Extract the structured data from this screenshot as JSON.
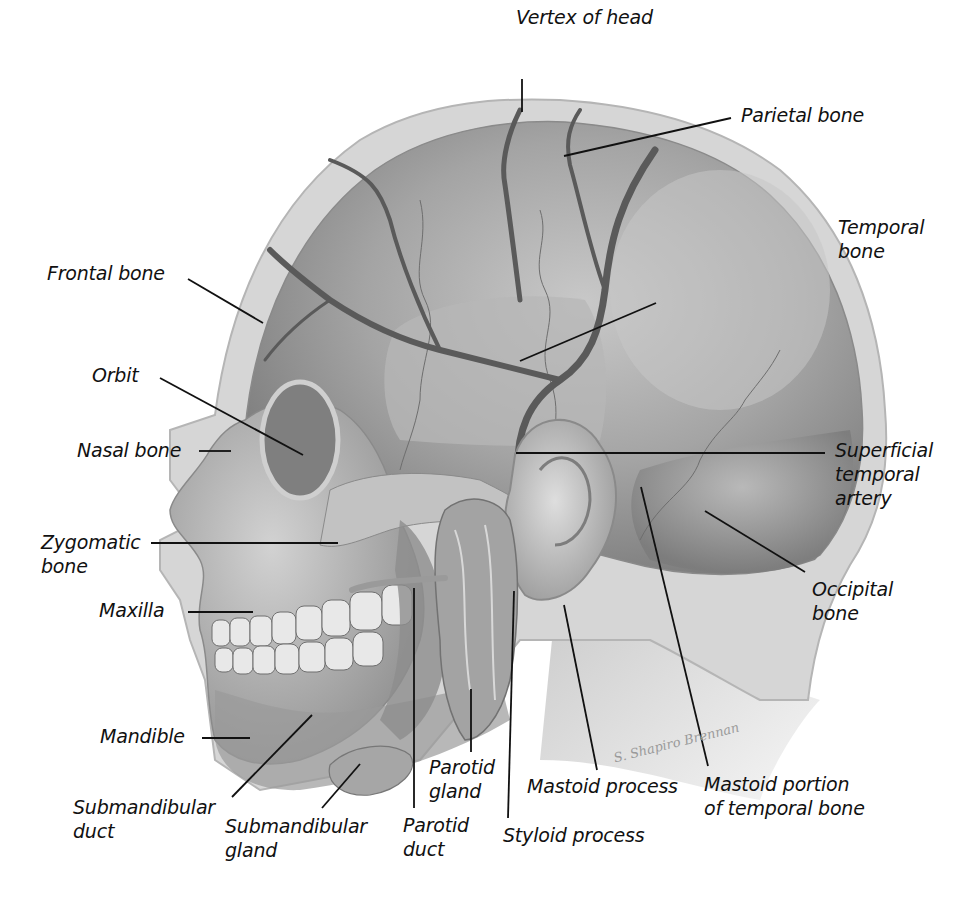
{
  "figure": {
    "type": "anatomical illustration",
    "colors": {
      "background": "#ffffff",
      "label_text": "#111111",
      "leader_line": "#111111",
      "scalp_outline": "#c9c9c9",
      "bone_mid": "#9d9d9d",
      "bone_dark": "#6e6e6e",
      "artery": "#5a5a5a",
      "signature": "#9a9a9a"
    }
  },
  "labels": [
    {
      "id": "vertex-of-head",
      "text": "Vertex of head"
    },
    {
      "id": "parietal-bone",
      "text": "Parietal bone"
    },
    {
      "id": "temporal-bone",
      "text": "Temporal\nbone"
    },
    {
      "id": "frontal-bone",
      "text": "Frontal bone"
    },
    {
      "id": "orbit",
      "text": "Orbit"
    },
    {
      "id": "nasal-bone",
      "text": "Nasal bone"
    },
    {
      "id": "superficial-temporal-artery",
      "text": "Superficial\ntemporal\nartery"
    },
    {
      "id": "zygomatic-bone",
      "text": "Zygomatic\nbone"
    },
    {
      "id": "occipital-bone",
      "text": "Occipital\nbone"
    },
    {
      "id": "maxilla",
      "text": "Maxilla"
    },
    {
      "id": "mandible",
      "text": "Mandible"
    },
    {
      "id": "parotid-gland",
      "text": "Parotid\ngland"
    },
    {
      "id": "mastoid-process",
      "text": "Mastoid process"
    },
    {
      "id": "mastoid-portion-of-temporal-bone",
      "text": "Mastoid portion\nof temporal bone"
    },
    {
      "id": "submandibular-duct",
      "text": "Submandibular\nduct"
    },
    {
      "id": "submandibular-gland",
      "text": "Submandibular\ngland"
    },
    {
      "id": "parotid-duct",
      "text": "Parotid\nduct"
    },
    {
      "id": "styloid-process",
      "text": "Styloid process"
    }
  ],
  "signature": "S. Shapiro Brennan"
}
